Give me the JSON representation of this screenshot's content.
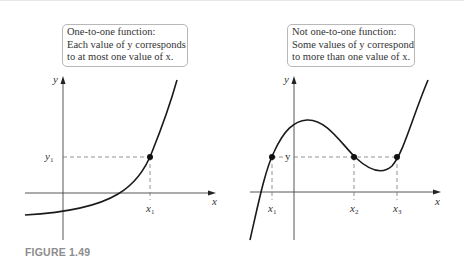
{
  "figure": {
    "caption": "FIGURE 1.49",
    "panels": [
      {
        "id": "left",
        "callout": {
          "lines": [
            "One-to-one function:",
            "Each value of y corresponds",
            "to at most one value of x."
          ]
        },
        "axis_labels": {
          "x": "x",
          "y": "y"
        },
        "point_labels": {
          "y": "y",
          "y_sub": "1",
          "x": "x",
          "x_sub": "1"
        }
      },
      {
        "id": "right",
        "callout": {
          "lines": [
            "Not one-to-one function:",
            "Some values of y correspond",
            "to more than one value of x."
          ]
        },
        "axis_labels": {
          "x": "x",
          "y": "y"
        },
        "point_labels": {
          "y": "y",
          "x1": "x",
          "x1_sub": "1",
          "x2": "x",
          "x2_sub": "2",
          "x3": "x",
          "x3_sub": "3"
        }
      }
    ]
  },
  "colors": {
    "curve": "#1a1a1a",
    "axis": "#333333",
    "dashed": "#777777",
    "caption": "#8c8c8c",
    "callout_border": "#b8b8b8"
  }
}
